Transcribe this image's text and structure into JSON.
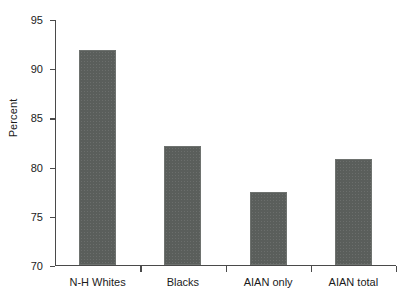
{
  "chart_data": {
    "type": "bar",
    "title": "",
    "subtitle": "",
    "xlabel": "",
    "ylabel": "Percent",
    "categories": [
      "N-H Whites",
      "Blacks",
      "AIAN only",
      "AIAN total"
    ],
    "values": [
      91.8,
      82.1,
      77.4,
      80.7
    ],
    "ylim": [
      70,
      95
    ],
    "ytick_step": 5,
    "ytick_labels": [
      "70",
      "75",
      "80",
      "85",
      "90",
      "95"
    ],
    "grid": false,
    "legend": false,
    "legend_position": "none",
    "bar_color": "#5a5e5b",
    "axis_color": "#4a4a4a",
    "background_color": "#ffffff"
  }
}
